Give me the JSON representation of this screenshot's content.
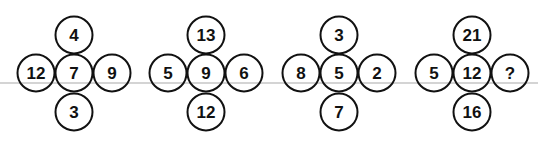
{
  "puzzle": {
    "groups": [
      {
        "top": "4",
        "left": "12",
        "center": "7",
        "right": "9",
        "bottom": "3"
      },
      {
        "top": "13",
        "left": "5",
        "center": "9",
        "right": "6",
        "bottom": "12"
      },
      {
        "top": "3",
        "left": "8",
        "center": "5",
        "right": "2",
        "bottom": "7"
      },
      {
        "top": "21",
        "left": "5",
        "center": "12",
        "right": "?",
        "bottom": "16"
      }
    ]
  }
}
